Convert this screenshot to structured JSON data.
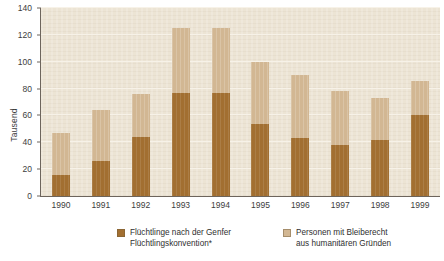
{
  "chart_data": {
    "type": "bar",
    "stacked": true,
    "title": "",
    "subtitle": "",
    "xlabel": "",
    "ylabel": "Tausend",
    "categories": [
      "1990",
      "1991",
      "1992",
      "1993",
      "1994",
      "1995",
      "1996",
      "1997",
      "1998",
      "1999"
    ],
    "series": [
      {
        "name": "Flüchtlinge nach der Genfer Flüchtlingskonvention*",
        "color": "#a26f31",
        "values": [
          16,
          26,
          44,
          77,
          77,
          54,
          43,
          38,
          42,
          60
        ]
      },
      {
        "name": "Personen mit Bleiberecht aus humanitären Gründen",
        "color": "#d2b793",
        "values": [
          31,
          38,
          32,
          48,
          48,
          46,
          47,
          40,
          31,
          26
        ]
      }
    ],
    "totals": [
      47,
      64,
      76,
      125,
      125,
      100,
      90,
      78,
      73,
      86
    ],
    "ylim": [
      0,
      140
    ],
    "yticks": [
      0,
      20,
      40,
      60,
      80,
      100,
      120,
      140
    ],
    "ytick_labels": [
      "0",
      "20",
      "40",
      "60",
      "80",
      "100",
      "120",
      "140"
    ],
    "grid": true,
    "grid_axis": "y",
    "legend_position": "bottom",
    "plot_background": "#ece4d4"
  },
  "axis": {
    "y_title": "Tausend"
  },
  "legend": {
    "items": [
      {
        "label": "Flüchtlinge nach der Genfer\nFlüchtlingskonvention*",
        "swatch": "dark"
      },
      {
        "label": "Personen mit Bleiberecht\naus humanitären Gründen",
        "swatch": "light"
      }
    ]
  }
}
